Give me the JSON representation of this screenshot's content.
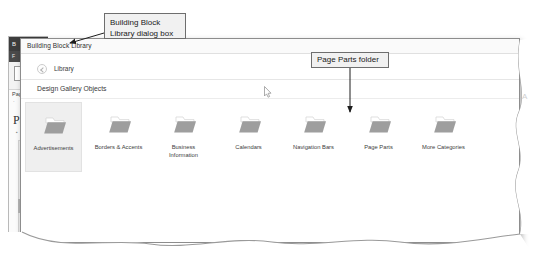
{
  "annotations": [
    {
      "id": "building-block-library-callout",
      "text": "Building Block\nLibrary dialog box"
    },
    {
      "id": "page-parts-folder-callout",
      "text": "Page Parts folder"
    }
  ],
  "underlying_window": {
    "title_fragment": "B",
    "ribbon_fragment": "F",
    "label_fragment_1": "Pag",
    "label_fragment_2": "·",
    "heading_fragment": "Pa",
    "bullet_fragment": "▪"
  },
  "dialog": {
    "title": "Building Block Library",
    "breadcrumb": {
      "back_icon": "circle-back-arrow-icon",
      "label": "Library"
    },
    "section_title": "Design Gallery Objects",
    "folders": [
      {
        "label": "Advertisements",
        "icon": "folder-icon",
        "selected": true
      },
      {
        "label": "Borders & Accents",
        "icon": "folder-icon",
        "selected": false
      },
      {
        "label": "Business\nInformation",
        "icon": "folder-icon",
        "selected": false
      },
      {
        "label": "Calendars",
        "icon": "folder-icon",
        "selected": false
      },
      {
        "label": "Navigation Bars",
        "icon": "folder-icon",
        "selected": false
      },
      {
        "label": "Page Parts",
        "icon": "folder-icon",
        "selected": false
      },
      {
        "label": "More Categories",
        "icon": "folder-icon",
        "selected": false
      }
    ]
  },
  "misc": {
    "edge_glyph": "A",
    "cursor": "mouse-pointer-icon"
  },
  "colors": {
    "callout_fill": "#f1f1f1",
    "callout_border": "#6e6e6e",
    "dialog_border": "#8d8d8d",
    "selected_tile": "#efefef",
    "folder_body": "#9e9e9e",
    "folder_tab": "#ffffff",
    "title_bar_dark": "#3d3d3d"
  }
}
